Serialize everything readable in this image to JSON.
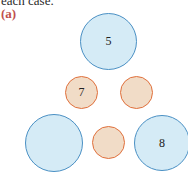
{
  "header": {
    "caption": "each case.",
    "part_label": "(a)"
  },
  "colors": {
    "blue_fill": "#d5ebf6",
    "blue_stroke": "#4a90c4",
    "orange_fill": "#f1dcc7",
    "orange_stroke": "#e0703c",
    "label_color": "#c0504d"
  },
  "diagram": {
    "circles": [
      {
        "id": "top",
        "type": "large-blue",
        "label": "5"
      },
      {
        "id": "middle-left",
        "type": "small-orange",
        "label": "7"
      },
      {
        "id": "middle-right",
        "type": "small-orange",
        "label": ""
      },
      {
        "id": "bottom-left",
        "type": "large-blue",
        "label": ""
      },
      {
        "id": "bottom-middle",
        "type": "small-orange",
        "label": ""
      },
      {
        "id": "bottom-right",
        "type": "large-blue",
        "label": "8"
      }
    ]
  }
}
